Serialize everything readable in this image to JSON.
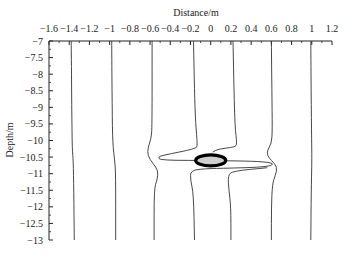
{
  "chart_data": {
    "type": "line",
    "title": "",
    "xlabel": "Distance/m",
    "ylabel": "Depth/m",
    "xlim": [
      -1.6,
      1.2
    ],
    "ylim": [
      -13,
      -7
    ],
    "x_axis_position": "top",
    "grid": false,
    "legend": null,
    "x_ticks": [
      -1.6,
      -1.4,
      -1.2,
      -1,
      -0.8,
      -0.6,
      -0.4,
      -0.2,
      0,
      0.2,
      0.4,
      0.6,
      0.8,
      1,
      1.2
    ],
    "x_tick_labels": [
      "−1.6",
      "−1.4",
      "−1.2",
      "−1",
      "−0.8",
      "−0.6",
      "−0.4",
      "−0.2",
      "0",
      "0.2",
      "0.4",
      "0.6",
      "0.8",
      "1",
      "1.2"
    ],
    "y_ticks": [
      -7,
      -7.5,
      -8,
      -8.5,
      -9,
      -9.5,
      -10,
      -10.5,
      -11,
      -11.5,
      -12,
      -12.5,
      -13
    ],
    "y_tick_labels": [
      "−7",
      "−7.5",
      "−8",
      "−8.5",
      "−9",
      "−9.5",
      "−10",
      "−10.5",
      "−11",
      "−11.5",
      "−12",
      "−12.5",
      "−13"
    ],
    "series": [
      {
        "name": "line-1",
        "points": [
          [
            -1.38,
            -7
          ],
          [
            -1.375,
            -9
          ],
          [
            -1.37,
            -10.3
          ],
          [
            -1.36,
            -10.6
          ],
          [
            -1.355,
            -11.5
          ],
          [
            -1.35,
            -13
          ]
        ]
      },
      {
        "name": "line-2",
        "points": [
          [
            -0.98,
            -7
          ],
          [
            -0.975,
            -9
          ],
          [
            -0.97,
            -10.1
          ],
          [
            -0.95,
            -10.6
          ],
          [
            -0.94,
            -11
          ],
          [
            -0.94,
            -13
          ]
        ]
      },
      {
        "name": "line-3",
        "points": [
          [
            -0.58,
            -7
          ],
          [
            -0.58,
            -9.6
          ],
          [
            -0.59,
            -9.95
          ],
          [
            -0.62,
            -10.2
          ],
          [
            -0.625,
            -10.45
          ],
          [
            -0.57,
            -10.7
          ],
          [
            -0.52,
            -10.9
          ],
          [
            -0.53,
            -11.2
          ],
          [
            -0.56,
            -11.45
          ],
          [
            -0.56,
            -13
          ]
        ]
      },
      {
        "name": "line-4",
        "points": [
          [
            -0.17,
            -7
          ],
          [
            -0.16,
            -8.5
          ],
          [
            -0.15,
            -9.5
          ],
          [
            -0.13,
            -10.15
          ],
          [
            -0.15,
            -10.25
          ],
          [
            -0.48,
            -10.45
          ],
          [
            -0.52,
            -10.5
          ],
          [
            -0.5,
            -10.6
          ],
          [
            0.06,
            -10.6
          ],
          [
            0.62,
            -10.64
          ],
          [
            0.6,
            -10.8
          ],
          [
            0.08,
            -10.84
          ],
          [
            -0.05,
            -10.85
          ],
          [
            -0.2,
            -10.9
          ],
          [
            -0.2,
            -11.2
          ],
          [
            -0.17,
            -11.6
          ],
          [
            -0.16,
            -13
          ]
        ]
      },
      {
        "name": "line-5",
        "points": [
          [
            0.22,
            -7
          ],
          [
            0.23,
            -8.5
          ],
          [
            0.24,
            -9.6
          ],
          [
            0.26,
            -10.1
          ],
          [
            0.24,
            -10.2
          ],
          [
            0.08,
            -10.25
          ],
          [
            0.02,
            -10.35
          ]
        ]
      },
      {
        "name": "line-5b",
        "points": [
          [
            0.56,
            -10.82
          ],
          [
            0.22,
            -10.92
          ],
          [
            0.17,
            -11.05
          ],
          [
            0.18,
            -11.5
          ],
          [
            0.2,
            -12
          ],
          [
            0.2,
            -13
          ]
        ]
      },
      {
        "name": "line-6",
        "points": [
          [
            0.6,
            -7
          ],
          [
            0.605,
            -8.5
          ],
          [
            0.61,
            -9.7
          ],
          [
            0.6,
            -10.1
          ],
          [
            0.56,
            -10.3
          ],
          [
            0.56,
            -10.45
          ],
          [
            0.6,
            -10.6
          ],
          [
            0.66,
            -10.8
          ],
          [
            0.64,
            -11.05
          ],
          [
            0.61,
            -11.3
          ],
          [
            0.6,
            -12
          ],
          [
            0.6,
            -13
          ]
        ]
      },
      {
        "name": "line-7",
        "points": [
          [
            0.99,
            -7
          ],
          [
            0.995,
            -9
          ],
          [
            1.0,
            -10.3
          ],
          [
            1.0,
            -10.75
          ],
          [
            0.995,
            -11.5
          ],
          [
            0.99,
            -13
          ]
        ]
      }
    ],
    "annotations": [
      {
        "type": "ellipse",
        "label": "tunnel",
        "center": [
          0.0,
          -10.6
        ],
        "rx": 0.15,
        "ry": 0.15
      }
    ]
  }
}
